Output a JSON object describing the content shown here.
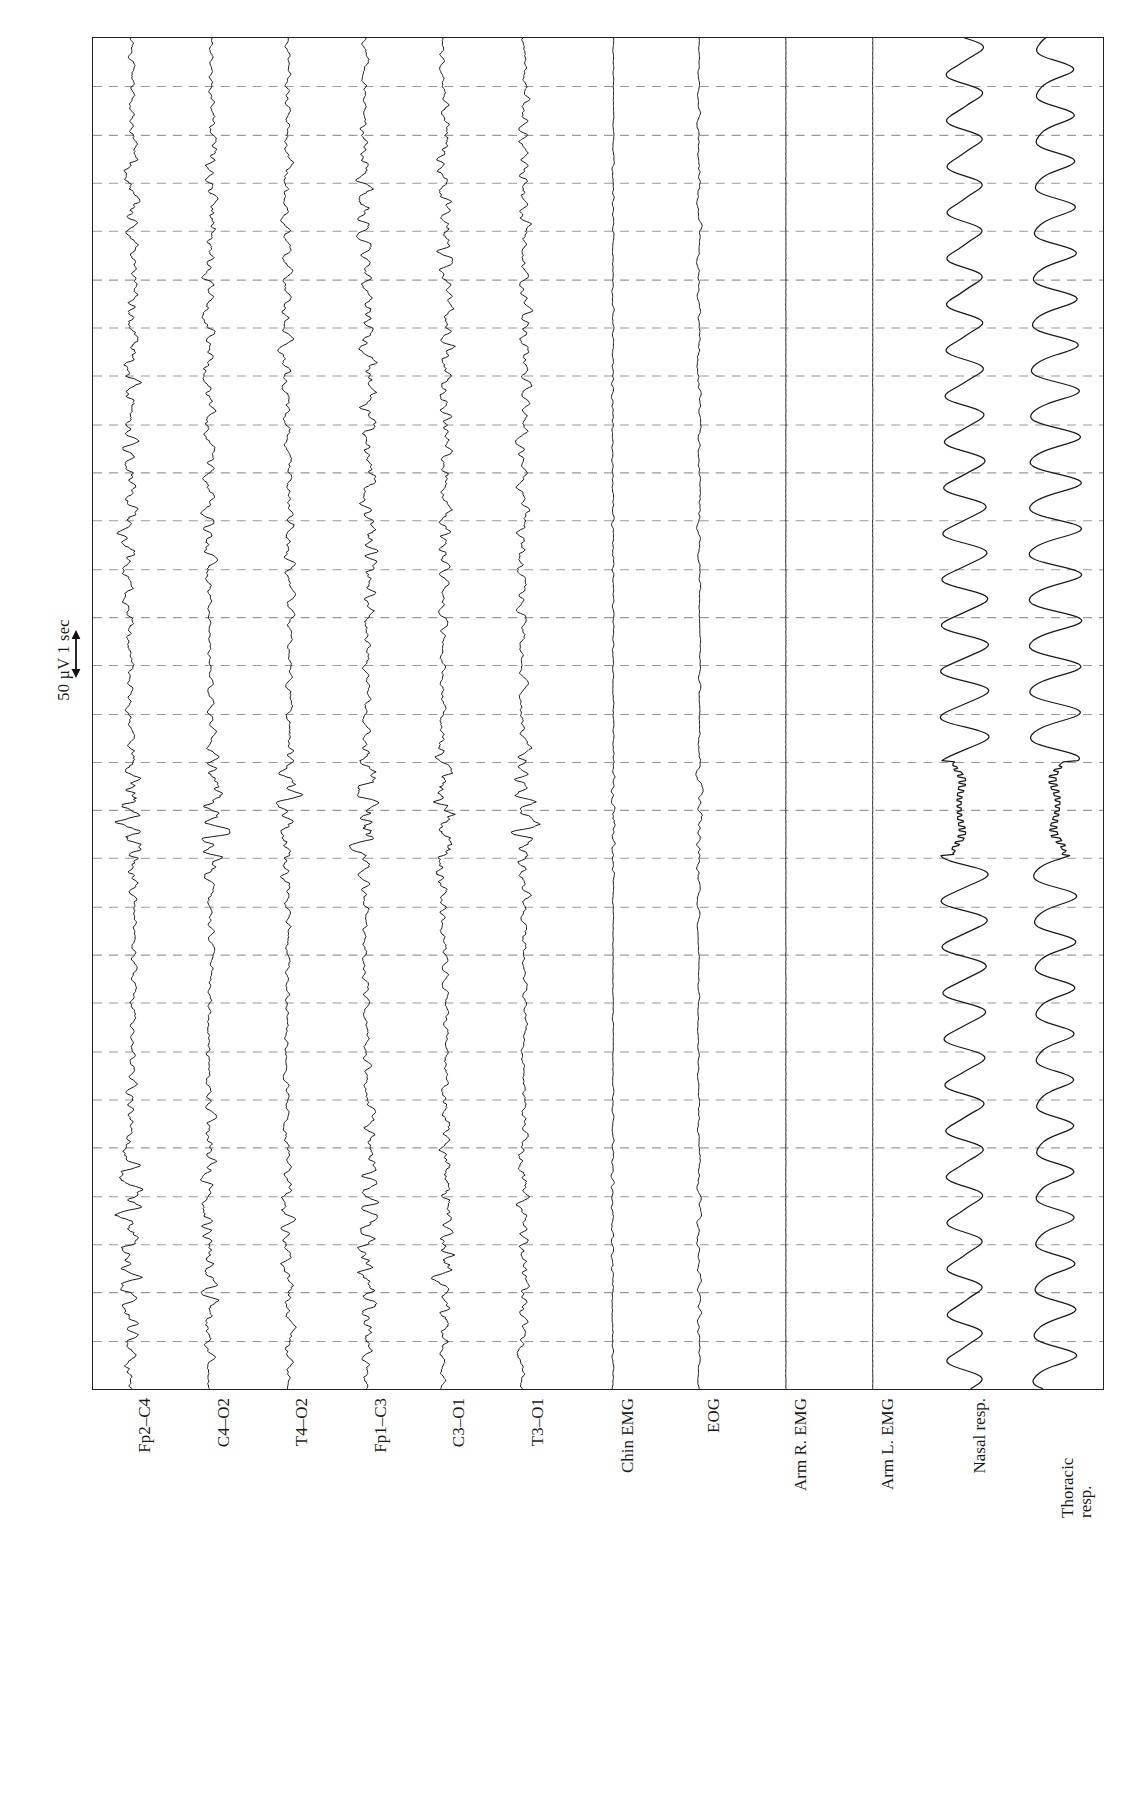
{
  "figure": {
    "kind": "polysomnogram",
    "orientation": "rotated-90",
    "background_color": "#ffffff",
    "trace_color": "#1a1a1a",
    "grid_color": "#9a9a9a",
    "border_color": "#222222"
  },
  "calibration": {
    "label": "50 µV 1 sec",
    "amplitude": "50 µV",
    "duration": "1 sec",
    "arrow_icon": "double-headed-arrow-icon"
  },
  "axis": {
    "gridlines_count": 27,
    "gridline_spacing_px": 50,
    "grid_style": "dashed",
    "x_ticks": [],
    "y_ticks": []
  },
  "channels": [
    {
      "id": "fp2-c4",
      "label": "Fp2–C4",
      "type": "EEG",
      "baseline_pct": 3.8,
      "amp": 13,
      "freq": 1.0,
      "flat": false,
      "resp": false
    },
    {
      "id": "c4-o2",
      "label": "C4–O2",
      "type": "EEG",
      "baseline_pct": 11.6,
      "amp": 11,
      "freq": 1.05,
      "flat": false,
      "resp": false
    },
    {
      "id": "t4-o2",
      "label": "T4–O2",
      "type": "EEG",
      "baseline_pct": 19.3,
      "amp": 9,
      "freq": 0.95,
      "flat": false,
      "resp": false
    },
    {
      "id": "fp1-c3",
      "label": "Fp1–C3",
      "type": "EEG",
      "baseline_pct": 27.1,
      "amp": 13,
      "freq": 1.1,
      "flat": false,
      "resp": false
    },
    {
      "id": "c3-o1",
      "label": "C3–O1",
      "type": "EEG",
      "baseline_pct": 34.8,
      "amp": 12,
      "freq": 1.15,
      "flat": false,
      "resp": false
    },
    {
      "id": "t3-o1",
      "label": "T3–O1",
      "type": "EEG",
      "amp": 10,
      "baseline_pct": 42.6,
      "freq": 0.9,
      "flat": false,
      "resp": false
    },
    {
      "id": "chin-emg",
      "label": "Chin EMG",
      "type": "EMG",
      "baseline_pct": 51.5,
      "amp": 2.2,
      "freq": 1.6,
      "flat": false,
      "resp": false
    },
    {
      "id": "eog",
      "label": "EOG",
      "type": "EOG",
      "baseline_pct": 60.0,
      "amp": 2.8,
      "freq": 0.7,
      "flat": false,
      "resp": false
    },
    {
      "id": "arm-r-emg",
      "label": "Arm R. EMG",
      "type": "EMG",
      "baseline_pct": 68.6,
      "amp": 0.0,
      "freq": 0.0,
      "flat": true,
      "resp": false
    },
    {
      "id": "arm-l-emg",
      "label": "Arm L. EMG",
      "type": "EMG",
      "baseline_pct": 77.2,
      "amp": 0.0,
      "freq": 0.0,
      "flat": true,
      "resp": false
    },
    {
      "id": "nasal-resp",
      "label": "Nasal resp.",
      "type": "RESP",
      "baseline_pct": 86.3,
      "amp": 20,
      "freq": 0.0,
      "flat": false,
      "resp": true,
      "phase": 0.0
    },
    {
      "id": "thoracic-resp",
      "label_line1": "Thoracic",
      "label_line2": "resp.",
      "label": "Thoracic resp.",
      "type": "RESP",
      "baseline_pct": 95.0,
      "amp": 22,
      "freq": 0.0,
      "flat": false,
      "resp": true,
      "phase": 0.55
    }
  ],
  "event": {
    "name": "arousal-respiratory-event",
    "start_pct": 53.5,
    "end_pct": 60.5,
    "description": "flattening / irregular excursion in nasal and thoracic respiration traces"
  }
}
